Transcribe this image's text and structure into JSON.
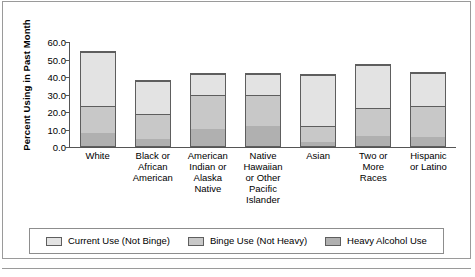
{
  "chart_data": {
    "type": "bar",
    "subtype": "stacked-bar",
    "title": "",
    "xlabel": "",
    "ylabel": "Percent Using in Past Month",
    "ylim": [
      0.0,
      60.0
    ],
    "ytick_step": 10.0,
    "ytick_labels": [
      "60.0",
      "50.0",
      "40.0",
      "30.0",
      "20.0",
      "10.0",
      "0.0"
    ],
    "ytick_values": [
      60.0,
      50.0,
      40.0,
      30.0,
      20.0,
      10.0,
      0.0
    ],
    "grid": false,
    "legend_position": "bottom",
    "categories": [
      "White",
      "Black or\nAfrican\nAmerican",
      "American\nIndian or\nAlaska\nNative",
      "Native\nHawaiian\nor Other\nPacific\nIslander",
      "Asian",
      "Two or\nMore\nRaces",
      "Hispanic\nor Latino"
    ],
    "series": [
      {
        "name": "Heavy Alcohol Use",
        "color": "#b0b0b0",
        "values": [
          7.5,
          4.0,
          10.0,
          12.0,
          2.5,
          6.0,
          5.0
        ]
      },
      {
        "name": "Binge Use (Not Heavy)",
        "color": "#c8c8c8",
        "values": [
          16.0,
          15.0,
          20.0,
          18.0,
          9.0,
          16.5,
          18.5
        ]
      },
      {
        "name": "Current Use (Not Binge)",
        "color": "#e3e3e3",
        "values": [
          31.5,
          19.5,
          12.5,
          12.5,
          30.0,
          25.0,
          19.5
        ]
      }
    ],
    "totals": [
      55.0,
      38.5,
      42.5,
      42.5,
      41.5,
      47.5,
      43.0
    ]
  },
  "legend": {
    "items": [
      {
        "label": "Current Use (Not Binge)",
        "color": "#e3e3e3"
      },
      {
        "label": "Binge Use (Not Heavy)",
        "color": "#c8c8c8"
      },
      {
        "label": "Heavy Alcohol Use",
        "color": "#b0b0b0"
      }
    ]
  },
  "colors": {
    "axis": "#555555",
    "bar_outline": "#5e5e5e",
    "frame": "#9a9a9a",
    "background": "#ffffff"
  }
}
